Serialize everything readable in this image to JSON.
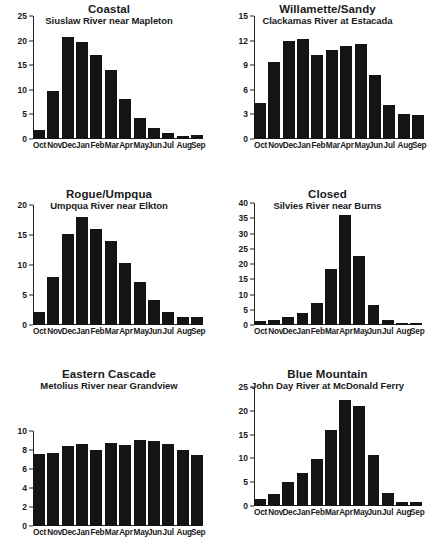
{
  "figure": {
    "kind": "small-multiples-bar-figure",
    "background": "#ffffff",
    "bar_color": "#141414",
    "axis_color": "#222222",
    "panel_count": 6
  },
  "chart_data": [
    {
      "type": "bar",
      "title": "Coastal",
      "subtitle": "Siuslaw River near Mapleton",
      "xlabel": "",
      "ylabel": "",
      "ylim": [
        0,
        25
      ],
      "yticks": [
        0,
        5,
        10,
        15,
        20,
        25
      ],
      "grid": false,
      "legend": "none",
      "categories": [
        "Oct",
        "Nov",
        "Dec",
        "Jan",
        "Feb",
        "Mar",
        "Apr",
        "May",
        "Jun",
        "Jul",
        "Aug",
        "Sep"
      ],
      "values": [
        1.9,
        9.8,
        20.8,
        19.8,
        17.0,
        14.0,
        8.1,
        4.2,
        2.3,
        1.3,
        0.7,
        0.9
      ]
    },
    {
      "type": "bar",
      "title": "Willamette/Sandy",
      "subtitle": "Clackamas River at Estacada",
      "xlabel": "",
      "ylabel": "",
      "ylim": [
        0,
        15
      ],
      "yticks": [
        0,
        3,
        6,
        9,
        12,
        15
      ],
      "grid": false,
      "legend": "none",
      "categories": [
        "Oct",
        "Nov",
        "Dec",
        "Jan",
        "Feb",
        "Mar",
        "Apr",
        "May",
        "Jun",
        "Jul",
        "Aug",
        "Sep"
      ],
      "values": [
        4.4,
        9.4,
        12.0,
        12.2,
        10.3,
        10.8,
        11.4,
        11.6,
        7.8,
        4.1,
        3.0,
        2.9
      ]
    },
    {
      "type": "bar",
      "title": "Rogue/Umpqua",
      "subtitle": "Umpqua River near Elkton",
      "xlabel": "",
      "ylabel": "",
      "ylim": [
        0,
        20
      ],
      "yticks": [
        0,
        5,
        10,
        15,
        20
      ],
      "grid": false,
      "legend": "none",
      "categories": [
        "Oct",
        "Nov",
        "Dec",
        "Jan",
        "Feb",
        "Mar",
        "Apr",
        "May",
        "Jun",
        "Jul",
        "Aug",
        "Sep"
      ],
      "values": [
        2.2,
        8.0,
        15.2,
        18.0,
        16.0,
        14.0,
        10.4,
        7.2,
        4.1,
        2.1,
        1.3,
        1.3
      ]
    },
    {
      "type": "bar",
      "title": "Closed",
      "subtitle": "Silvies River near Burns",
      "xlabel": "",
      "ylabel": "",
      "ylim": [
        0,
        40
      ],
      "yticks": [
        0,
        5,
        10,
        15,
        20,
        25,
        30,
        35,
        40
      ],
      "grid": false,
      "legend": "none",
      "categories": [
        "Oct",
        "Nov",
        "Dec",
        "Jan",
        "Feb",
        "Mar",
        "Apr",
        "May",
        "Jun",
        "Jul",
        "Aug",
        "Sep"
      ],
      "values": [
        1.2,
        1.8,
        2.6,
        4.0,
        7.1,
        18.3,
        36.1,
        22.5,
        6.6,
        1.8,
        0.8,
        0.7
      ]
    },
    {
      "type": "bar",
      "title": "Eastern Cascade",
      "subtitle": "Metolius River near Grandview",
      "xlabel": "",
      "ylabel": "",
      "ylim": [
        0,
        10
      ],
      "yticks": [
        0,
        2,
        4,
        6,
        8,
        10
      ],
      "grid": false,
      "legend": "none",
      "categories": [
        "Oct",
        "Nov",
        "Dec",
        "Jan",
        "Feb",
        "Mar",
        "Apr",
        "May",
        "Jun",
        "Jul",
        "Aug",
        "Sep"
      ],
      "values": [
        7.6,
        7.7,
        8.4,
        8.6,
        8.0,
        8.7,
        8.5,
        9.1,
        9.0,
        8.6,
        8.0,
        7.5
      ]
    },
    {
      "type": "bar",
      "title": "Blue Mountain",
      "subtitle": "John Day River at McDonald Ferry",
      "xlabel": "",
      "ylabel": "",
      "ylim": [
        0,
        25
      ],
      "yticks": [
        0,
        5,
        10,
        15,
        20,
        25
      ],
      "grid": false,
      "legend": "none",
      "categories": [
        "Oct",
        "Nov",
        "Dec",
        "Jan",
        "Feb",
        "Mar",
        "Apr",
        "May",
        "Jun",
        "Jul",
        "Aug",
        "Sep"
      ],
      "values": [
        1.5,
        2.6,
        5.0,
        6.9,
        9.8,
        16.0,
        22.3,
        21.1,
        10.8,
        2.8,
        0.9,
        0.8
      ]
    }
  ]
}
